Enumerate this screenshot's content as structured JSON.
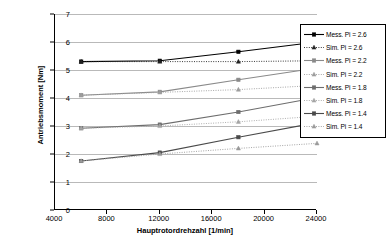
{
  "chart_data": {
    "type": "line",
    "title": "",
    "xlabel": "Hauptrotordrehzahl [1/min]",
    "ylabel": "Antriebsmoment [Nm]",
    "xlim": [
      4000,
      24000
    ],
    "ylim": [
      0,
      7
    ],
    "xticks": [
      "4000",
      "8000",
      "12000",
      "16000",
      "20000",
      "24000"
    ],
    "xtick_values": [
      4000,
      8000,
      12000,
      16000,
      20000,
      24000
    ],
    "yticks": [
      "0",
      "1",
      "2",
      "3",
      "4",
      "5",
      "6",
      "7"
    ],
    "ytick_values": [
      0,
      1,
      2,
      3,
      4,
      5,
      6,
      7
    ],
    "grid": "horizontal",
    "legend_position": "right",
    "x": [
      6000,
      12000,
      18000,
      24000
    ],
    "series": [
      {
        "name": "Mess. Pi = 2.6",
        "values": [
          5.3,
          5.33,
          5.65,
          6.0
        ],
        "style": "solid",
        "marker": "square",
        "color": "#000000"
      },
      {
        "name": "Sim. Pi = 2.6",
        "values": [
          5.3,
          5.3,
          5.3,
          5.33
        ],
        "style": "dotted",
        "marker": "triangle",
        "color": "#222222"
      },
      {
        "name": "Mess. Pi = 2.2",
        "values": [
          4.1,
          4.22,
          4.65,
          5.07
        ],
        "style": "solid",
        "marker": "square",
        "color": "#8a8a8a"
      },
      {
        "name": "Sim. Pi = 2.2",
        "values": [
          4.1,
          4.2,
          4.3,
          4.45
        ],
        "style": "dotted",
        "marker": "triangle",
        "color": "#9d9d9d"
      },
      {
        "name": "Mess. Pi = 1.8",
        "values": [
          2.92,
          3.05,
          3.5,
          4.02
        ],
        "style": "solid",
        "marker": "square",
        "color": "#6d6d6d"
      },
      {
        "name": "Sim. Pi = 1.8",
        "values": [
          2.92,
          3.0,
          3.15,
          3.35
        ],
        "style": "dotted",
        "marker": "triangle",
        "color": "#a5a5a5"
      },
      {
        "name": "Mess. Pi = 1.4",
        "values": [
          1.75,
          2.05,
          2.6,
          3.12
        ],
        "style": "solid",
        "marker": "square",
        "color": "#4a4a4a"
      },
      {
        "name": "Sim. Pi = 1.4",
        "values": [
          1.75,
          2.0,
          2.2,
          2.38
        ],
        "style": "dotted",
        "marker": "triangle",
        "color": "#9a9a9a"
      }
    ]
  }
}
